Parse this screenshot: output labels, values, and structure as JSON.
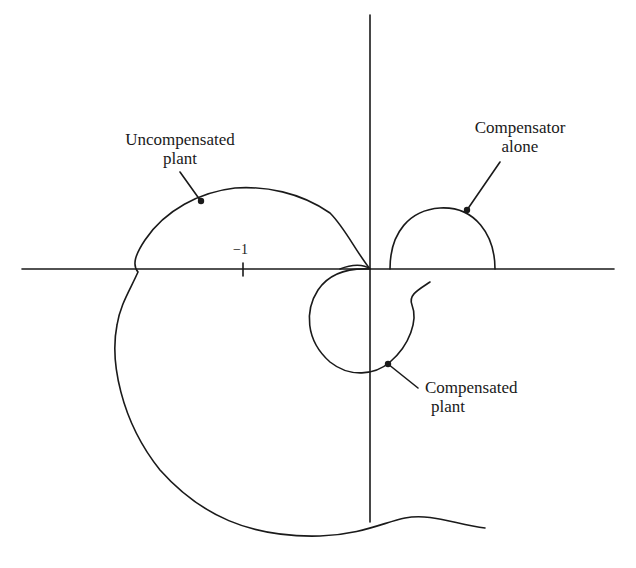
{
  "diagram": {
    "type": "nyquist-plot",
    "axes": {
      "real_axis_tick_label": "−1"
    },
    "labels": {
      "uncompensated": {
        "line1": "Uncompensated",
        "line2": "plant"
      },
      "compensator": {
        "line1": "Compensator",
        "line2": "alone"
      },
      "compensated": {
        "line1": "Compensated",
        "line2": "plant"
      }
    },
    "colors": {
      "ink": "#1a1a1a",
      "background": "#ffffff"
    }
  }
}
